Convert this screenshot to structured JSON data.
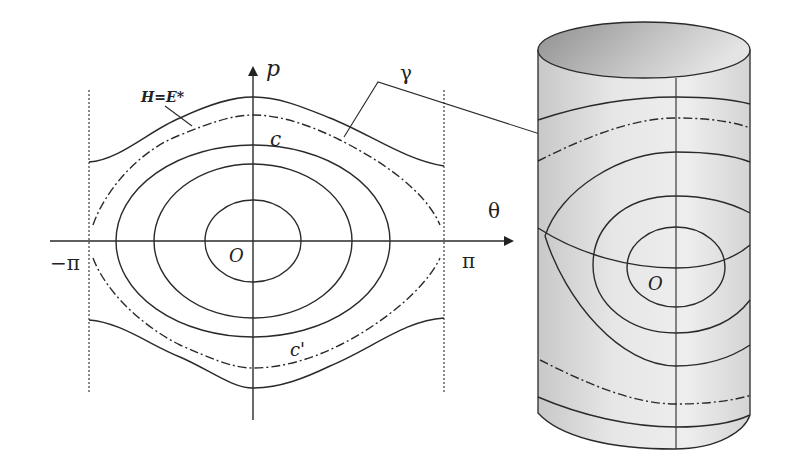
{
  "figure": {
    "type": "phase-portrait-and-cylinder",
    "phase_plane": {
      "axis_p_label": "p",
      "axis_theta_label": "θ",
      "origin_label": "O",
      "left_bound_label": "−π",
      "right_bound_label": "π",
      "separatrix_label": "H=E*",
      "curve_c_label": "c",
      "curve_c_prime_label": "c'",
      "gamma_label": "γ"
    },
    "cylinder": {
      "origin_label": "O"
    }
  },
  "colors": {
    "line": "#2a2a2a",
    "cylinder_light": "#efefef",
    "cylinder_dark": "#9a9a9a"
  }
}
